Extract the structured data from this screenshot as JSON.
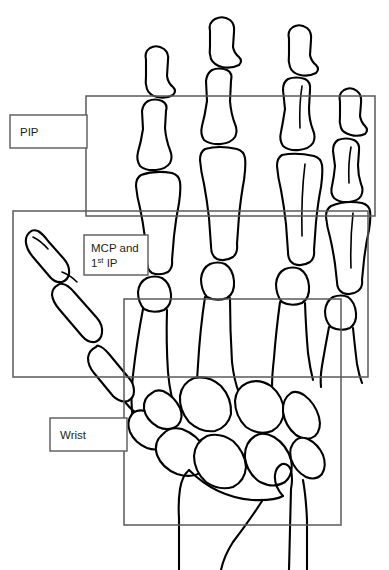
{
  "figure": {
    "view": "posteroanterior",
    "background_color": "#ffffff",
    "bone_outline_color": "#000000",
    "box_color": "#59595b",
    "label_text_color": "#231f20"
  },
  "labels": [
    {
      "id": "pip",
      "text": "PIP",
      "meaning": "proximal interphalangeal joints",
      "box": {
        "x": 10,
        "y": 115,
        "w": 77,
        "h": 33
      },
      "text_x": 20,
      "text_y": 136
    },
    {
      "id": "mcp",
      "text_line1": "MCP and",
      "text_line2_pre": "1",
      "text_line2_sup": "st",
      "text_line2_post": " IP",
      "meaning": "metacarpophalangeal joints and first interphalangeal joint",
      "box": {
        "x": 84,
        "y": 235,
        "w": 64,
        "h": 40
      },
      "text_x": 91,
      "text_y": 252
    },
    {
      "id": "wrist",
      "text": "Wrist",
      "meaning": "carpal and radiocarpal region",
      "box": {
        "x": 50,
        "y": 418,
        "w": 77,
        "h": 33
      },
      "text_x": 60,
      "text_y": 439
    }
  ],
  "regions": [
    {
      "id": "pip-region",
      "label_ref": "pip",
      "box": {
        "x": 86,
        "y": 96,
        "w": 289,
        "h": 120
      }
    },
    {
      "id": "mcp-region",
      "label_ref": "mcp",
      "box": {
        "x": 13,
        "y": 211,
        "w": 355,
        "h": 166
      }
    },
    {
      "id": "wrist-region",
      "label_ref": "wrist",
      "box": {
        "x": 124,
        "y": 299,
        "w": 217,
        "h": 226
      }
    }
  ],
  "leaders": [
    {
      "id": "pip-leader",
      "from_x": 87,
      "from_y": 131,
      "to_x": 86,
      "to_y": 131
    },
    {
      "id": "mcp-leader",
      "from_x": 148,
      "from_y": 255,
      "to_x": 148,
      "to_y": 255
    },
    {
      "id": "wrist-leader",
      "from_x": 127,
      "from_y": 434,
      "to_x": 124,
      "to_y": 434
    }
  ],
  "anatomy": {
    "digits": [
      {
        "name": "thumb",
        "bones": [
          "distal phalanx",
          "proximal phalanx",
          "first metacarpal"
        ]
      },
      {
        "name": "index finger",
        "bones": [
          "distal phalanx",
          "middle phalanx",
          "proximal phalanx",
          "second metacarpal"
        ]
      },
      {
        "name": "middle finger",
        "bones": [
          "distal phalanx",
          "middle phalanx",
          "proximal phalanx",
          "third metacarpal"
        ]
      },
      {
        "name": "ring finger",
        "bones": [
          "distal phalanx",
          "middle phalanx",
          "proximal phalanx",
          "fourth metacarpal"
        ]
      },
      {
        "name": "little finger",
        "bones": [
          "distal phalanx",
          "middle phalanx",
          "proximal phalanx",
          "fifth metacarpal"
        ]
      }
    ],
    "carpals": [
      "scaphoid",
      "lunate",
      "triquetrum",
      "pisiform",
      "trapezium",
      "trapezoid",
      "capitate",
      "hamate"
    ],
    "forearm": [
      "radius",
      "ulna"
    ]
  }
}
